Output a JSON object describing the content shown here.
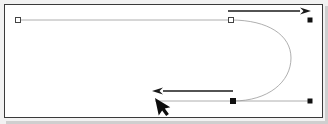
{
  "app": {
    "title": "Vector Path Editor Canvas",
    "background_color": "#ffffff",
    "frame_border_color": "#3a3a3a",
    "outer_background_color": "#f2f2f2"
  },
  "canvas": {
    "name": "drawing-canvas",
    "width": 319,
    "height": 114,
    "origin_x": 4,
    "origin_y": 4
  },
  "path": {
    "name": "u-turn-bezier-path",
    "stroke_color": "#9a9a9a",
    "stroke_width": 0.8,
    "description": "Open path: long horizontal top segment, U-turn curve at right, long horizontal bottom segment",
    "d": "M 18 20 L 231 20 C 268 20 291 35 291 58 C 291 82 268 101 233 101 L 310 101",
    "segments": [
      {
        "type": "line",
        "from": [
          18,
          20
        ],
        "to": [
          231,
          20
        ]
      },
      {
        "type": "cubic",
        "from": [
          231,
          20
        ],
        "c1": [
          268,
          20
        ],
        "c2": [
          291,
          35
        ],
        "to": [
          291,
          58
        ]
      },
      {
        "type": "cubic",
        "from": [
          291,
          58
        ],
        "c1": [
          291,
          82
        ],
        "c2": [
          268,
          101
        ],
        "to": [
          233,
          101
        ]
      },
      {
        "type": "line",
        "from": [
          233,
          101
        ],
        "to": [
          310,
          101
        ]
      }
    ]
  },
  "anchors": [
    {
      "name": "anchor-point-start",
      "x": 18,
      "y": 20,
      "style": "hollow-square",
      "size": 5,
      "fill": "#ffffff",
      "stroke": "#444444"
    },
    {
      "name": "anchor-point-curve-top",
      "x": 231,
      "y": 20,
      "style": "hollow-square",
      "size": 5,
      "fill": "#ffffff",
      "stroke": "#444444"
    },
    {
      "name": "anchor-point-curve-bottom",
      "x": 233,
      "y": 101,
      "style": "filled-square",
      "size": 5,
      "fill": "#111111",
      "stroke": "#111111"
    },
    {
      "name": "anchor-point-top-end",
      "x": 310,
      "y": 20,
      "style": "filled-square",
      "size": 4,
      "fill": "#111111",
      "stroke": "#111111"
    },
    {
      "name": "anchor-point-bottom-end",
      "x": 310,
      "y": 101,
      "style": "filled-square",
      "size": 4,
      "fill": "#111111",
      "stroke": "#111111"
    }
  ],
  "annotations": [
    {
      "name": "direction-arrow-right",
      "label": "forward direction arrow",
      "color": "#1a1a1a",
      "from": [
        228,
        11
      ],
      "to": [
        311,
        11
      ],
      "head": "right",
      "stroke_width": 1.6
    },
    {
      "name": "direction-arrow-left",
      "label": "return direction arrow",
      "color": "#1a1a1a",
      "from": [
        233,
        91
      ],
      "to": [
        152,
        91
      ],
      "head": "left",
      "stroke_width": 1.6
    }
  ],
  "cursor": {
    "name": "mouse-pointer-cursor",
    "color": "#0d0d0d",
    "tip_x": 155,
    "tip_y": 98,
    "scale": 1.0
  },
  "bottom_guide": {
    "name": "bottom-guide-line",
    "from": [
      155,
      101
    ],
    "to": [
      233,
      101
    ],
    "stroke_color": "#9a9a9a"
  }
}
